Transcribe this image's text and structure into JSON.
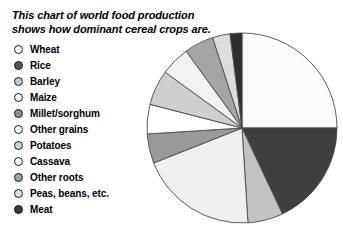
{
  "chart_data": {
    "type": "pie",
    "title": "This chart of world food production shows how dominant cereal crops are.",
    "xlabel": "",
    "ylabel": "",
    "legend_position": "left",
    "grid": false,
    "start_angle_deg": 0,
    "direction": "clockwise",
    "categories": [
      "Wheat",
      "Rice",
      "Barley",
      "Maize",
      "Millet/sorghum",
      "Other grains",
      "Potatoes",
      "Cassava",
      "Other roots",
      "Peas, beans, etc.",
      "Meat"
    ],
    "values": [
      25,
      18,
      6,
      20,
      5,
      5,
      6,
      5,
      5,
      3,
      2
    ],
    "slice_colors": [
      "#fbfbf9",
      "#3f3f3f",
      "#c2c2c2",
      "#efefed",
      "#9a9a9a",
      "#ffffff",
      "#cfcfcf",
      "#f2f2f0",
      "#a5a5a5",
      "#dcdcdc",
      "#2e2e2e"
    ],
    "slice_outline_color": "#4a4a4a"
  },
  "legend": {
    "items": [
      {
        "label": "Wheat",
        "color": "#ffffff"
      },
      {
        "label": "Rice",
        "color": "#535353"
      },
      {
        "label": "Barley",
        "color": "#c9c9c9"
      },
      {
        "label": "Maize",
        "color": "#f4f4f2"
      },
      {
        "label": "Millet/sorghum",
        "color": "#8e8e8e"
      },
      {
        "label": "Other grains",
        "color": "#ffffff"
      },
      {
        "label": "Potatoes",
        "color": "#d2d2d2"
      },
      {
        "label": "Cassava",
        "color": "#f6f6f4"
      },
      {
        "label": "Other roots",
        "color": "#9f9f9f"
      },
      {
        "label": "Peas, beans, etc.",
        "color": "#dedede"
      },
      {
        "label": "Meat",
        "color": "#3a3a3a"
      }
    ]
  },
  "pie_geometry": {
    "center_x": 97,
    "center_y": 98,
    "radius": 95
  }
}
